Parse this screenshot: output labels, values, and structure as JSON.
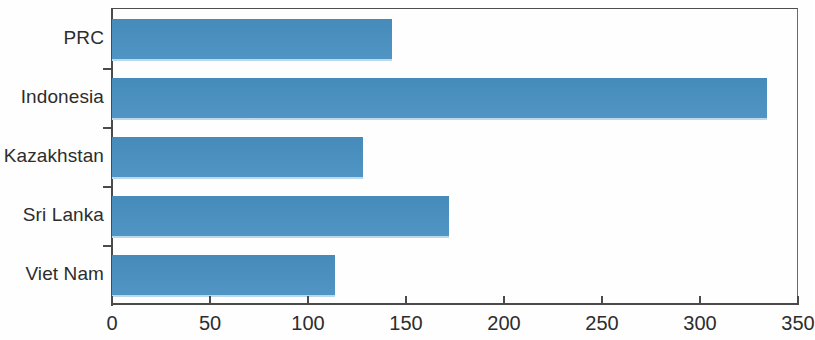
{
  "chart_data": {
    "type": "bar",
    "orientation": "horizontal",
    "title": "",
    "subtitle": "",
    "xlabel": "",
    "ylabel": "",
    "categories": [
      "PRC",
      "Indonesia",
      "Kazakhstan",
      "Sri Lanka",
      "Viet Nam"
    ],
    "values": [
      143,
      334,
      128,
      172,
      114
    ],
    "series": [
      {
        "name": "",
        "values": [
          143,
          334,
          128,
          172,
          114
        ]
      }
    ],
    "xlim": [
      0,
      350
    ],
    "xticks": [
      0,
      50,
      100,
      150,
      200,
      250,
      300,
      350
    ],
    "xtick_labels": [
      "0",
      "50",
      "100",
      "150",
      "200",
      "250",
      "300",
      "350"
    ],
    "grid": false,
    "legend": false,
    "legend_position": "none",
    "bar_color": "#4890c0",
    "axis_color": "#4a4a4a",
    "frame": true,
    "annotations": []
  },
  "axis": {
    "x_tick_labels": [
      "0",
      "50",
      "100",
      "150",
      "200",
      "250",
      "300",
      "350"
    ],
    "category_labels": [
      "PRC",
      "Indonesia",
      "Kazakhstan",
      "Sri Lanka",
      "Viet Nam"
    ]
  }
}
